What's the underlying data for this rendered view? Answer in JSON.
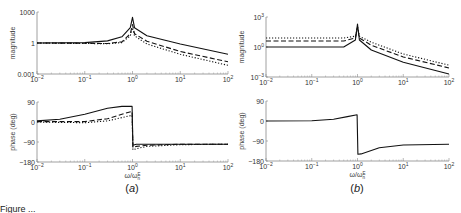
{
  "figure": {
    "caption_text": "Figure ...",
    "panels": [
      "(a)",
      "(b)"
    ]
  },
  "chart_data": [
    {
      "type": "line",
      "panel": "(a)",
      "subplot": "magnitude",
      "xscale": "log",
      "yscale": "log",
      "xlim": [
        0.01,
        100
      ],
      "ylim": [
        0.001,
        1000
      ],
      "xticks": [
        "10^-2",
        "10^-1",
        "10^0",
        "10^1",
        "10^2"
      ],
      "yticks": [
        "0.001",
        "1",
        "1000"
      ],
      "xlabel": "",
      "ylabel": "magnitude",
      "grid": false,
      "x": [
        0.01,
        0.1,
        0.3,
        0.6,
        0.9,
        1.0,
        1.1,
        2,
        10,
        100
      ],
      "series": [
        {
          "name": "solid",
          "style": "solid",
          "values": [
            1,
            1.1,
            1.6,
            4,
            30,
            300,
            30,
            5,
            0.8,
            0.08
          ]
        },
        {
          "name": "dashed",
          "style": "dashed",
          "values": [
            1,
            0.95,
            0.9,
            1.3,
            8,
            60,
            8,
            1.5,
            0.15,
            0.015
          ]
        },
        {
          "name": "dotted",
          "style": "dotted",
          "values": [
            1,
            0.9,
            0.85,
            1.1,
            5,
            30,
            5,
            0.8,
            0.08,
            0.007
          ]
        }
      ]
    },
    {
      "type": "line",
      "panel": "(a)",
      "subplot": "phase",
      "xscale": "log",
      "xlim": [
        0.01,
        100
      ],
      "ylim": [
        -180,
        90
      ],
      "xticks": [
        "10^-2",
        "10^-1",
        "10^0",
        "10^1",
        "10^2"
      ],
      "yticks": [
        "-180",
        "-90",
        "0",
        "90"
      ],
      "xlabel": "ω/ω_n^E",
      "ylabel": "phase (deg)",
      "grid": false,
      "x": [
        0.01,
        0.03,
        0.1,
        0.3,
        0.6,
        0.98,
        1.02,
        1.2,
        2,
        10,
        100
      ],
      "series": [
        {
          "name": "solid",
          "style": "solid",
          "values": [
            5,
            12,
            35,
            62,
            70,
            70,
            -105,
            -100,
            -100,
            -100,
            -100
          ]
        },
        {
          "name": "dashed",
          "style": "dashed",
          "values": [
            2,
            2,
            2,
            15,
            35,
            48,
            -115,
            -110,
            -105,
            -100,
            -100
          ]
        },
        {
          "name": "dotted",
          "style": "dotted",
          "values": [
            0,
            -2,
            -3,
            5,
            20,
            30,
            -125,
            -120,
            -110,
            -102,
            -100
          ]
        }
      ]
    },
    {
      "type": "line",
      "panel": "(b)",
      "subplot": "magnitude",
      "xscale": "log",
      "yscale": "log",
      "xlim": [
        0.01,
        100
      ],
      "ylim": [
        0.001,
        1000
      ],
      "xticks": [
        "10^-2",
        "10^-1",
        "10^0",
        "10^1",
        "10^2"
      ],
      "yticks": [
        "10^-3",
        "10^0",
        "10^3"
      ],
      "xlabel": "",
      "ylabel": "magnitude",
      "grid": false,
      "x": [
        0.01,
        0.1,
        0.5,
        0.9,
        1.0,
        1.1,
        2,
        10,
        100
      ],
      "series": [
        {
          "name": "solid",
          "style": "solid",
          "values": [
            1,
            1,
            1,
            5,
            200,
            5,
            0.5,
            0.03,
            0.002
          ]
        },
        {
          "name": "dashed",
          "style": "dashed",
          "values": [
            4,
            4,
            4,
            8,
            100,
            8,
            1.5,
            0.1,
            0.008
          ]
        },
        {
          "name": "dotted",
          "style": "dotted",
          "values": [
            8,
            8,
            8,
            12,
            100,
            12,
            3,
            0.2,
            0.015
          ]
        }
      ]
    },
    {
      "type": "line",
      "panel": "(b)",
      "subplot": "phase",
      "xscale": "log",
      "xlim": [
        0.01,
        100
      ],
      "ylim": [
        -180,
        90
      ],
      "xticks": [
        "10^-2",
        "10^-1",
        "10^0",
        "10^1",
        "10^2"
      ],
      "yticks": [
        "-180",
        "-90",
        "0",
        "90"
      ],
      "xlabel": "ω/ω_n^E",
      "ylabel": "phase (deg)",
      "grid": false,
      "x": [
        0.01,
        0.1,
        0.3,
        0.6,
        0.98,
        1.02,
        1.2,
        3,
        10,
        100
      ],
      "series": [
        {
          "name": "solid",
          "style": "solid",
          "values": [
            0,
            1,
            8,
            20,
            28,
            -150,
            -148,
            -120,
            -108,
            -105
          ]
        }
      ]
    }
  ]
}
